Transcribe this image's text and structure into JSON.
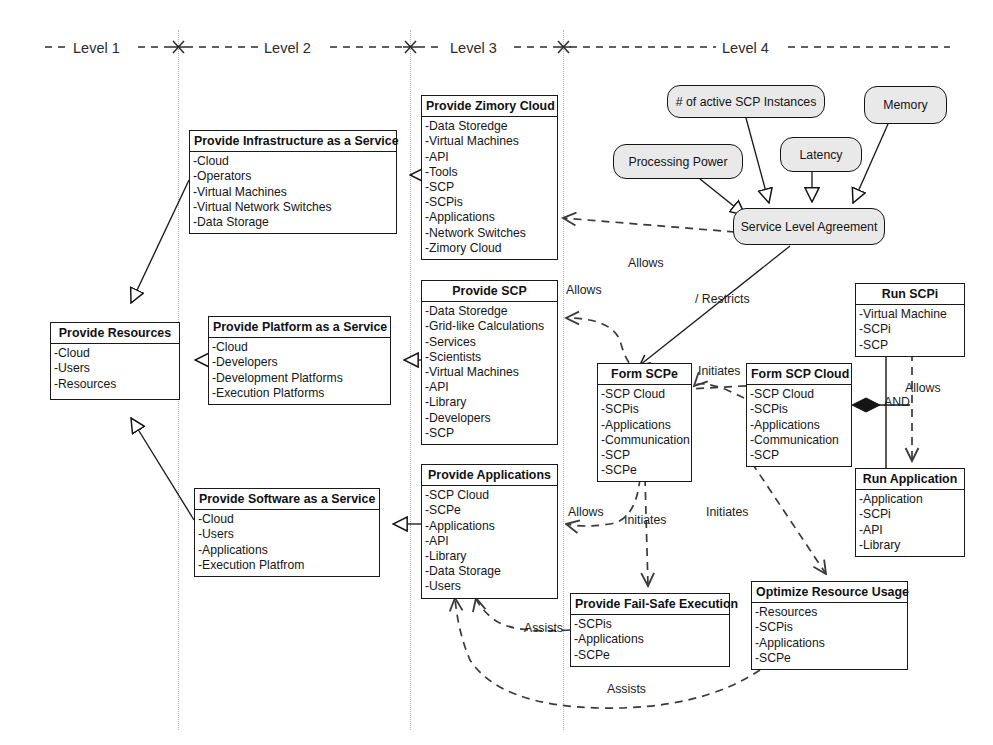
{
  "diagram": {
    "levels": [
      {
        "id": "level-1",
        "label": "Level 1"
      },
      {
        "id": "level-2",
        "label": "Level 2"
      },
      {
        "id": "level-3",
        "label": "Level 3"
      },
      {
        "id": "level-4",
        "label": "Level 4"
      }
    ],
    "classes": [
      {
        "id": "provide-resources",
        "title": "Provide Resources",
        "items": [
          "-Cloud",
          "-Users",
          "-Resources"
        ],
        "x": 50,
        "y": 322,
        "w": 130,
        "h": 78
      },
      {
        "id": "provide-infrastructure-as-a-service",
        "title": "Provide Infrastructure as a Service",
        "items": [
          "-Cloud",
          "-Operators",
          "-Virtual Machines",
          "-Virtual Network Switches",
          "-Data Storage"
        ],
        "x": 189,
        "y": 130,
        "w": 208,
        "h": 104
      },
      {
        "id": "provide-platform-as-a-service",
        "title": "Provide Platform as a Service",
        "items": [
          "-Cloud",
          "-Developers",
          "-Development Platforms",
          "-Execution Platforms"
        ],
        "x": 208,
        "y": 316,
        "w": 183,
        "h": 88
      },
      {
        "id": "provide-software-as-a-service",
        "title": "Provide Software as a Service",
        "items": [
          "-Cloud",
          "-Users",
          "-Applications",
          "-Execution Platfrom"
        ],
        "x": 194,
        "y": 488,
        "w": 186,
        "h": 88
      },
      {
        "id": "provide-zimory-cloud",
        "title": "Provide Zimory Cloud",
        "items": [
          "-Data Storedge",
          "-Virtual Machines",
          "-API",
          "-Tools",
          "-SCP",
          "-SCPis",
          "-Applications",
          "-Network Switches",
          "-Zimory Cloud"
        ],
        "x": 421,
        "y": 95,
        "w": 137,
        "h": 158
      },
      {
        "id": "provide-scp",
        "title": "Provide SCP",
        "items": [
          "-Data Storedge",
          "-Grid-like Calculations",
          "-Services",
          "-Scientists",
          "-Virtual Machines",
          "-API",
          "-Library",
          "-Developers",
          "-SCP"
        ],
        "x": 421,
        "y": 280,
        "w": 137,
        "h": 158
      },
      {
        "id": "provide-applications",
        "title": "Provide Applications",
        "items": [
          "-SCP Cloud",
          "-SCPe",
          "-Applications",
          "-API",
          "-Library",
          "-Data Storage",
          "-Users"
        ],
        "x": 421,
        "y": 464,
        "w": 137,
        "h": 127
      },
      {
        "id": "form-scpe",
        "title": "Form SCPe",
        "items": [
          "-SCP Cloud",
          "-SCPis",
          "-Applications",
          "-Communication",
          "-SCP",
          "-SCPe"
        ],
        "x": 597,
        "y": 363,
        "w": 95,
        "h": 113
      },
      {
        "id": "form-scp-cloud",
        "title": "Form SCP Cloud",
        "items": [
          "-SCP Cloud",
          "-SCPis",
          "-Applications",
          "-Communication",
          "-SCP"
        ],
        "x": 746,
        "y": 363,
        "w": 106,
        "h": 99
      },
      {
        "id": "run-scpi",
        "title": "Run SCPi",
        "items": [
          "-Virtual Machine",
          "-SCPi",
          "-SCP"
        ],
        "x": 855,
        "y": 283,
        "w": 110,
        "h": 69
      },
      {
        "id": "run-application",
        "title": "Run Application",
        "items": [
          "-Application",
          "-SCPi",
          "-API",
          "-Library"
        ],
        "x": 855,
        "y": 468,
        "w": 110,
        "h": 84
      },
      {
        "id": "provide-fail-safe-execution",
        "title": "Provide Fail-Safe Execution",
        "items": [
          "-SCPis",
          "-Applications",
          "-SCPe"
        ],
        "x": 570,
        "y": 593,
        "w": 160,
        "h": 72
      },
      {
        "id": "optimize-resource-usage",
        "title": "Optimize Resource Usage",
        "items": [
          "-Resources",
          "-SCPis",
          "-Applications",
          "-SCPe"
        ],
        "x": 751,
        "y": 581,
        "w": 157,
        "h": 88
      }
    ],
    "rounded_nodes": [
      {
        "id": "processing-power",
        "label": "Processing Power",
        "x": 613,
        "y": 144,
        "w": 130,
        "h": 35
      },
      {
        "id": "active-scp-instances",
        "label": "# of active SCP Instances",
        "x": 667,
        "y": 85,
        "w": 158,
        "h": 33
      },
      {
        "id": "latency",
        "label": "Latency",
        "x": 780,
        "y": 137,
        "w": 82,
        "h": 35
      },
      {
        "id": "memory",
        "label": "Memory",
        "x": 864,
        "y": 86,
        "w": 83,
        "h": 38
      },
      {
        "id": "service-level-agreement",
        "label": "Service Level Agreement",
        "x": 733,
        "y": 208,
        "w": 152,
        "h": 37
      }
    ],
    "edge_labels": [
      {
        "id": "allows-sla-to-zimory",
        "text": "Allows",
        "x": 628,
        "y": 256
      },
      {
        "id": "allows-scp",
        "text": "Allows",
        "x": 566,
        "y": 283
      },
      {
        "id": "restricts",
        "text": "/ Restricts",
        "x": 695,
        "y": 292
      },
      {
        "id": "initiates-scpe-cloud",
        "text": "Initiates",
        "x": 698,
        "y": 364
      },
      {
        "id": "allows-and",
        "text": "Allows",
        "x": 905,
        "y": 381
      },
      {
        "id": "allows-applications",
        "text": "Allows",
        "x": 568,
        "y": 505
      },
      {
        "id": "initiates-failsafe",
        "text": "Initiates",
        "x": 624,
        "y": 513
      },
      {
        "id": "initiates-optimize",
        "text": "Initiates",
        "x": 706,
        "y": 505
      },
      {
        "id": "and-operator",
        "text": "AND",
        "x": 884,
        "y": 395
      },
      {
        "id": "assists-upper",
        "text": "Assists",
        "x": 524,
        "y": 621
      },
      {
        "id": "assists-lower",
        "text": "Assists",
        "x": 607,
        "y": 682
      }
    ],
    "colors": {
      "stroke": "#141414",
      "rounded_fill": "#e9e9e9",
      "divider": "#b4b4b4",
      "text": "#161616"
    }
  }
}
